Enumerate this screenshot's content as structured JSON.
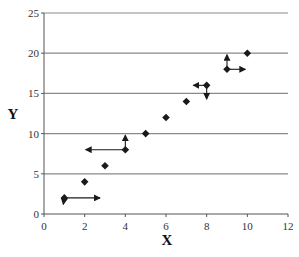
{
  "chart_data": {
    "type": "scatter",
    "title": "",
    "xlabel": "X",
    "ylabel": "Y",
    "xlim": [
      0,
      12
    ],
    "ylim": [
      0,
      25
    ],
    "xticks": [
      0,
      2,
      4,
      6,
      8,
      10,
      12
    ],
    "yticks": [
      0,
      5,
      10,
      15,
      20,
      25
    ],
    "grid": "horizontal",
    "legend": null,
    "series": [
      {
        "name": "data",
        "marker": "diamond",
        "x": [
          1,
          2,
          3,
          4,
          5,
          6,
          7,
          8,
          9,
          10
        ],
        "y": [
          2,
          4,
          6,
          8,
          10,
          12,
          14,
          16,
          18,
          20
        ]
      }
    ],
    "annotations": [
      {
        "type": "arrow",
        "from": [
          1,
          2
        ],
        "to": [
          2.75,
          2
        ],
        "direction": "right"
      },
      {
        "type": "arrow",
        "from": [
          1,
          2
        ],
        "to": [
          0.95,
          1.2
        ],
        "direction": "down"
      },
      {
        "type": "arrow",
        "from": [
          4,
          8
        ],
        "to": [
          2.05,
          8
        ],
        "direction": "left"
      },
      {
        "type": "arrow",
        "from": [
          4,
          8
        ],
        "to": [
          4,
          9.8
        ],
        "direction": "up"
      },
      {
        "type": "arrow",
        "from": [
          8,
          16
        ],
        "to": [
          7.35,
          16
        ],
        "direction": "left"
      },
      {
        "type": "arrow",
        "from": [
          8,
          16
        ],
        "to": [
          8,
          14.3
        ],
        "direction": "down"
      },
      {
        "type": "arrow",
        "from": [
          9,
          18
        ],
        "to": [
          9,
          19.8
        ],
        "direction": "up"
      },
      {
        "type": "arrow",
        "from": [
          9,
          18
        ],
        "to": [
          9.9,
          18
        ],
        "direction": "right"
      }
    ]
  },
  "colors": {
    "axis": "#555555",
    "grid": "#8a8a8a",
    "marker": "#1a1a1a",
    "text": "#333333"
  }
}
